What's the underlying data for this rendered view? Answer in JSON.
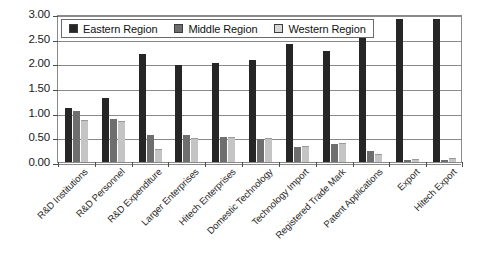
{
  "chart_data": {
    "type": "bar",
    "title": "",
    "subtitle": "",
    "xlabel": "",
    "ylabel": "",
    "ylim": [
      0.0,
      3.0
    ],
    "ytick_step": 0.5,
    "ytick_labels": [
      "3.00",
      "2.50",
      "2.00",
      "1.50",
      "1.00",
      "0.50",
      "0.00"
    ],
    "ytick_values": [
      3.0,
      2.5,
      2.0,
      1.5,
      1.0,
      0.5,
      0.0
    ],
    "grid": true,
    "grid_axis": "y",
    "legend_position": "top-left-inside",
    "categories": [
      "R&D Institutions",
      "R&D Personnel",
      "R&D Expenditure",
      "Larger Enterprises",
      "Hitech Enterprises",
      "Domestic Technology",
      "Technology Import",
      "Registered Trade Mark",
      "Patent Applications",
      "Export",
      "Hitech Export"
    ],
    "series": [
      {
        "name": "Eastern Region",
        "color": "#262626",
        "values": [
          1.09,
          1.29,
          2.18,
          1.96,
          2.0,
          2.06,
          2.39,
          2.25,
          2.55,
          2.9,
          2.9
        ]
      },
      {
        "name": "Middle Region",
        "color": "#6e6e6e",
        "values": [
          1.03,
          0.88,
          0.54,
          0.55,
          0.5,
          0.46,
          0.3,
          0.37,
          0.22,
          0.04,
          0.05
        ]
      },
      {
        "name": "Western Region",
        "color": "#c4c4c4",
        "values": [
          0.86,
          0.83,
          0.27,
          0.48,
          0.5,
          0.48,
          0.32,
          0.38,
          0.17,
          0.06,
          0.08
        ]
      }
    ]
  },
  "legend": {
    "items": [
      {
        "label": "Eastern Region",
        "swatch": "eastern"
      },
      {
        "label": "Middle Region",
        "swatch": "middle"
      },
      {
        "label": "Western Region",
        "swatch": "western"
      }
    ]
  }
}
